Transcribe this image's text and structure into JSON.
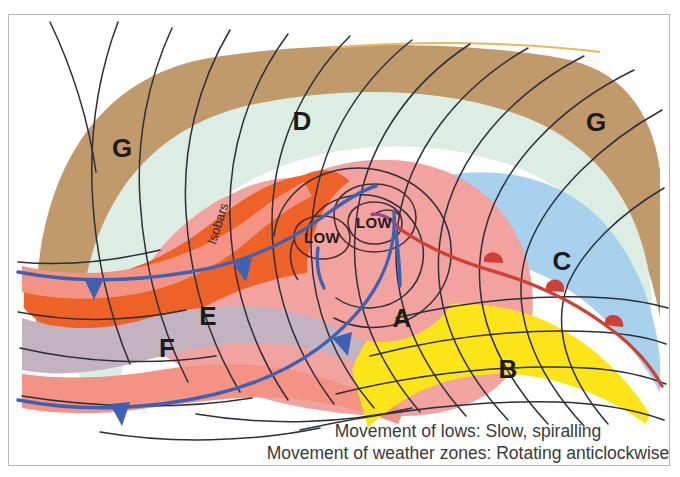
{
  "figure": {
    "background_color": "#ffffff",
    "border_color": "#b9b9b9"
  },
  "caption": {
    "line1": "Movement of lows: Slow, spiralling",
    "line2": "Movement of weather zones: Rotating anticlockwise"
  },
  "annotations": {
    "isobars_label": "Isobars",
    "low_center_primary": "LOW",
    "low_center_secondary": "LOW"
  },
  "zone_labels": [
    {
      "id": "zone-g-left",
      "letter": "G",
      "x": 122,
      "y": 157,
      "color": "#c19a6b",
      "description": "outer brown zone, left"
    },
    {
      "id": "zone-d",
      "letter": "D",
      "x": 302,
      "y": 130,
      "color": "#dceee4",
      "description": "pale mint zone, top centre"
    },
    {
      "id": "zone-g-right",
      "letter": "G",
      "x": 596,
      "y": 131,
      "color": "#c19a6b",
      "description": "outer brown zone, right"
    },
    {
      "id": "zone-c",
      "letter": "C",
      "x": 562,
      "y": 270,
      "color": "#a8d1ee",
      "description": "light blue zone, right"
    },
    {
      "id": "zone-e",
      "letter": "E",
      "x": 208,
      "y": 325,
      "color": "#ef6227",
      "description": "orange zone, left of centre"
    },
    {
      "id": "zone-a",
      "letter": "A",
      "x": 402,
      "y": 327,
      "color": "#f2a3a0",
      "description": "pink zone, centre"
    },
    {
      "id": "zone-f",
      "letter": "F",
      "x": 167,
      "y": 357,
      "color": "#c3b2bf",
      "description": "grey-lavender zone, lower left"
    },
    {
      "id": "zone-b",
      "letter": "B",
      "x": 508,
      "y": 378,
      "color": "#fbe519",
      "description": "yellow zone, lower right"
    }
  ],
  "palette": {
    "brown": "#c19a6b",
    "mint": "#dceee4",
    "pink": "#f2a3a0",
    "orange": "#ef6227",
    "light_blue": "#a8d1ee",
    "yellow": "#fbe519",
    "grey_lavender": "#c3b2bf",
    "salmon": "#f49384",
    "isobar_line": "#2c2f3a",
    "cold_front": "#3d62b5",
    "warm_front": "#cf3f33",
    "occluded_front": "#8c4b8f",
    "text": "#1b1b17",
    "caption_text": "#3a3a3a",
    "top_streak": "#e8b957"
  },
  "fronts": {
    "cold_front_name": "cold front",
    "cold_front_symbol": "filled triangles",
    "cold_front_count": 4,
    "warm_front_name": "warm front",
    "warm_front_symbol": "filled semicircles",
    "warm_front_count": 3
  }
}
